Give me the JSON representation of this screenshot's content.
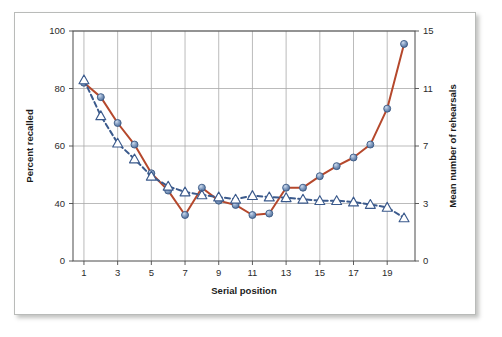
{
  "figure": {
    "background_color": "#ffffff",
    "border_color": "#b9bbb9"
  },
  "chart_data": {
    "type": "line",
    "title": "",
    "subtitle": "",
    "xlabel": "Serial position",
    "ylabel": "Percent recalled",
    "y2label": "Mean number of rehearsals",
    "grid": true,
    "legend_position": "none",
    "x": [
      1,
      2,
      3,
      4,
      5,
      6,
      7,
      8,
      9,
      10,
      11,
      12,
      13,
      14,
      15,
      16,
      17,
      18,
      19,
      20
    ],
    "xticks": [
      1,
      3,
      5,
      7,
      9,
      11,
      13,
      15,
      17,
      19
    ],
    "xticklabels": [
      "1",
      "3",
      "5",
      "7",
      "9",
      "11",
      "13",
      "15",
      "17",
      "19"
    ],
    "xlim": [
      0.35,
      20.65
    ],
    "yticks": [
      0,
      40,
      60,
      80,
      100
    ],
    "yticklabels": [
      "0",
      "40",
      "60",
      "80",
      "100"
    ],
    "ylim": [
      0,
      100
    ],
    "y2ticks": [
      0,
      3,
      7,
      11,
      15
    ],
    "y2ticklabels": [
      "0",
      "3",
      "7",
      "11",
      "15"
    ],
    "y2lim": [
      0,
      15
    ],
    "axis_note": "Both axes use evenly spaced gridlines at the listed tick values; the interval from 0 to the next tick is compressed relative to the uniform upper intervals.",
    "series": [
      {
        "name": "Percent recalled",
        "axis": "left",
        "line_style": "solid",
        "line_color": "#b5482c",
        "line_width": 2.0,
        "marker": "circle",
        "marker_face_color": "#7c96bd",
        "marker_edge_color": "#3c5a85",
        "marker_size": 7,
        "values": [
          82,
          77,
          68,
          60.5,
          50.5,
          44.5,
          32,
          45.5,
          41,
          39,
          32,
          33,
          45.5,
          45.5,
          49.5,
          53,
          56,
          60.5,
          73,
          95.5
        ]
      },
      {
        "name": "Mean number of rehearsals",
        "axis": "right",
        "line_style": "dashed",
        "line_color": "#3b5a8c",
        "line_width": 2.0,
        "marker": "triangle",
        "marker_face_color": "#ffffff",
        "marker_edge_color": "#3b5a8c",
        "marker_size": 8,
        "values": [
          11.6,
          9.1,
          7.2,
          6.1,
          4.9,
          4.2,
          3.8,
          3.6,
          3.45,
          3.3,
          3.55,
          3.45,
          3.4,
          3.3,
          3.2,
          3.2,
          3.1,
          2.95,
          2.8,
          2.25
        ]
      }
    ]
  }
}
